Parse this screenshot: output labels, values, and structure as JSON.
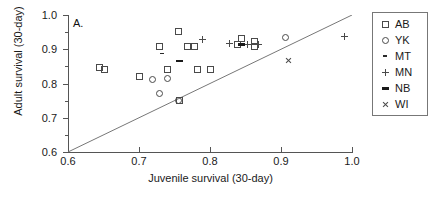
{
  "panel": {
    "label": "A."
  },
  "axes": {
    "xlabel": "Juvenile survival (30-day)",
    "ylabel": "Adult survival (30-day)",
    "xticks": [
      "0.6",
      "0.7",
      "0.8",
      "0.9",
      "1.0"
    ],
    "yticks": [
      "1.0",
      "0.9",
      "0.8",
      "0.7",
      "0.6"
    ],
    "xlim": [
      0.6,
      1.0
    ],
    "ylim": [
      0.6,
      1.0
    ]
  },
  "legend": {
    "items": [
      {
        "label": "AB",
        "symbol": "open-square",
        "key": "AB"
      },
      {
        "label": "YK",
        "symbol": "open-circle",
        "key": "YK"
      },
      {
        "label": "MT",
        "symbol": "small-dash",
        "key": "MT"
      },
      {
        "label": "MN",
        "symbol": "plus",
        "key": "MN"
      },
      {
        "label": "NB",
        "symbol": "thick-dash",
        "key": "NB"
      },
      {
        "label": "WI",
        "symbol": "cross-x",
        "key": "WI"
      }
    ]
  },
  "colors": {
    "marker": "#4a4a4a",
    "axis": "#555555",
    "text": "#1a1a1a",
    "reference_line": "#777777"
  },
  "chart_data": {
    "type": "scatter",
    "title": "",
    "xlabel": "Juvenile survival (30-day)",
    "ylabel": "Adult survival (30-day)",
    "xlim": [
      0.6,
      1.0
    ],
    "ylim": [
      0.6,
      1.0
    ],
    "grid": false,
    "legend_position": "right-outside",
    "annotations": [
      {
        "text": "A.",
        "x": 0.608,
        "y": 0.985
      },
      {
        "text": "1:1 reference line",
        "x0": 0.6,
        "y0": 0.6,
        "x1": 1.0,
        "y1": 1.0
      }
    ],
    "series": [
      {
        "name": "AB",
        "marker": "open-square",
        "points": [
          [
            0.643,
            0.848
          ],
          [
            0.65,
            0.843
          ],
          [
            0.7,
            0.822
          ],
          [
            0.728,
            0.91
          ],
          [
            0.74,
            0.843
          ],
          [
            0.755,
            0.952
          ],
          [
            0.757,
            0.752
          ],
          [
            0.768,
            0.91
          ],
          [
            0.778,
            0.91
          ],
          [
            0.782,
            0.843
          ],
          [
            0.8,
            0.841
          ],
          [
            0.838,
            0.916
          ],
          [
            0.843,
            0.933
          ],
          [
            0.862,
            0.91
          ],
          [
            0.862,
            0.925
          ]
        ]
      },
      {
        "name": "YK",
        "marker": "open-circle",
        "points": [
          [
            0.718,
            0.812
          ],
          [
            0.728,
            0.771
          ],
          [
            0.74,
            0.817
          ],
          [
            0.755,
            0.753
          ],
          [
            0.905,
            0.936
          ]
        ]
      },
      {
        "name": "MT",
        "marker": "small-dash",
        "points": [
          [
            0.733,
            0.887
          ]
        ]
      },
      {
        "name": "MN",
        "marker": "plus",
        "points": [
          [
            0.79,
            0.928
          ],
          [
            0.828,
            0.917
          ],
          [
            0.853,
            0.914
          ],
          [
            0.868,
            0.913
          ],
          [
            0.99,
            0.938
          ]
        ]
      },
      {
        "name": "NB",
        "marker": "thick-dash",
        "points": [
          [
            0.757,
            0.867
          ],
          [
            0.845,
            0.915
          ]
        ]
      },
      {
        "name": "WI",
        "marker": "cross-x",
        "points": [
          [
            0.91,
            0.868
          ]
        ]
      }
    ]
  }
}
